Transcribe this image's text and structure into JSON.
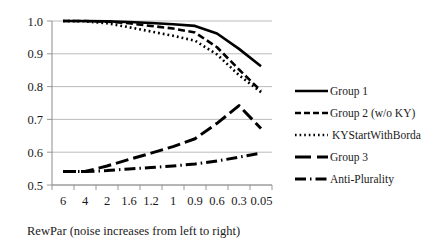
{
  "chart_data": {
    "type": "line",
    "title": "",
    "xlabel": "RewPar (noise increases from left to right)",
    "ylabel": "",
    "categories": [
      "6",
      "4",
      "2",
      "1.6",
      "1.2",
      "1",
      "0.9",
      "0.6",
      "0.3",
      "0.05"
    ],
    "yticks": [
      "0.5",
      "0.6",
      "0.7",
      "0.8",
      "0.9",
      "1.0"
    ],
    "ylim": [
      0.5,
      1.0
    ],
    "grid": true,
    "legend_position": "right",
    "series": [
      {
        "name": "Group 1",
        "style": "solid",
        "values": [
          1.0,
          1.0,
          0.999,
          0.997,
          0.994,
          0.99,
          0.985,
          0.962,
          0.915,
          0.862
        ]
      },
      {
        "name": "Group 2 (w/o KY)",
        "style": "dashed",
        "values": [
          1.0,
          1.0,
          0.998,
          0.993,
          0.985,
          0.977,
          0.965,
          0.92,
          0.852,
          0.787
        ]
      },
      {
        "name": "KYStartWithBorda",
        "style": "dotted",
        "values": [
          1.0,
          0.999,
          0.993,
          0.981,
          0.968,
          0.955,
          0.94,
          0.898,
          0.835,
          0.783
        ]
      },
      {
        "name": "Group 3",
        "style": "long-dash",
        "values": [
          0.541,
          0.541,
          0.558,
          0.578,
          0.597,
          0.617,
          0.641,
          0.688,
          0.742,
          0.672
        ]
      },
      {
        "name": "Anti-Plurality",
        "style": "dash-dot",
        "values": [
          0.541,
          0.541,
          0.544,
          0.549,
          0.553,
          0.558,
          0.564,
          0.573,
          0.585,
          0.597
        ]
      }
    ]
  },
  "legend": {
    "items": [
      {
        "label": "Group 1",
        "swatch": "solid-line-swatch"
      },
      {
        "label": "Group 2 (w/o KY)",
        "swatch": "dashed-line-swatch"
      },
      {
        "label": "KYStartWithBorda",
        "swatch": "dotted-line-swatch"
      },
      {
        "label": "Group 3",
        "swatch": "long-dash-line-swatch"
      },
      {
        "label": "Anti-Plurality",
        "swatch": "dash-dot-line-swatch"
      }
    ]
  },
  "colors": {
    "series": "#000000",
    "grid": "#b3b3b3",
    "axis": "#8c8c8c",
    "text": "#1a1a1a",
    "background": "#ffffff"
  }
}
